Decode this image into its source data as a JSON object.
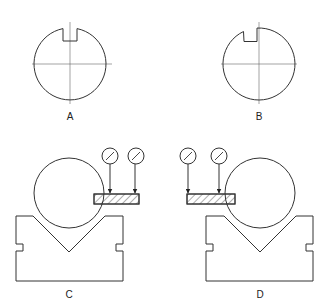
{
  "figure": {
    "type": "technical-illustration",
    "line_color": "#333333",
    "centerline_color": "#555555",
    "background": "#ffffff"
  },
  "panels": [
    {
      "id": "A",
      "label": "A",
      "description": "shaft cross-section with keyway centered on vertical centerline"
    },
    {
      "id": "B",
      "label": "B",
      "description": "shaft cross-section with keyway offset to the left of vertical centerline"
    },
    {
      "id": "C",
      "label": "C",
      "description": "shaft in V-block with gauge block on right, two dial indicators"
    },
    {
      "id": "D",
      "label": "D",
      "description": "shaft in V-block with gauge block on left, two dial indicators"
    }
  ],
  "icons": {
    "dial_indicator": "dial-indicator-icon",
    "v_block": "v-block-icon",
    "gauge_block": "hatched-gauge-block-icon"
  }
}
